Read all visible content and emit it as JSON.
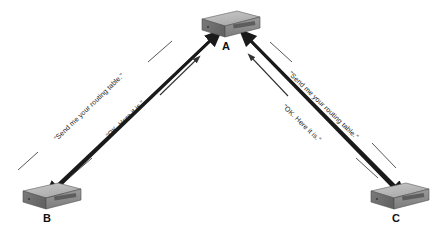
{
  "diagram": {
    "type": "network-routing-update",
    "background_color": "#ffffff",
    "nodes": [
      {
        "id": "A",
        "label": "A",
        "device": "router",
        "x": 229,
        "y": 24,
        "label_x": 222,
        "label_y": 41
      },
      {
        "id": "B",
        "label": "B",
        "device": "router",
        "x": 50,
        "y": 196,
        "label_x": 43,
        "label_y": 213
      },
      {
        "id": "C",
        "label": "C",
        "device": "router",
        "x": 398,
        "y": 196,
        "label_x": 392,
        "label_y": 213
      }
    ],
    "links": [
      {
        "id": "a-b",
        "from": "A",
        "to": "B",
        "request_label": "\"Send me your routing table.\"",
        "reply_label": "\"OK. Here it is.\"",
        "request_direction": "A-to-B",
        "reply_direction": "B-to-A"
      },
      {
        "id": "a-c",
        "from": "A",
        "to": "C",
        "request_label": "\"Send me your routing table.\"",
        "reply_label": "\"OK. Here it is.\"",
        "request_direction": "A-to-C",
        "reply_direction": "C-to-A"
      }
    ],
    "colors": {
      "line": "#1a1a1a",
      "thin_line": "#555555",
      "label_text": "#111111",
      "router_top": "#b6b6b6",
      "router_front": "#8d8d8d",
      "router_side": "#6e6e6e",
      "router_panel": "#5a5a5a",
      "router_outline": "#4a4a4a"
    },
    "labels": {
      "request": "\"Send me your routing table.\"",
      "reply": "\"OK. Here it is.\""
    }
  }
}
